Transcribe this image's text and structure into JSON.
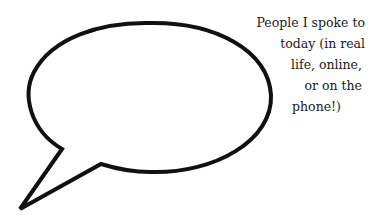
{
  "caption": {
    "lines": [
      {
        "text": "People I spoke to",
        "indent": 0
      },
      {
        "text": "today (in real",
        "indent": 0
      },
      {
        "text": "life, online,",
        "indent": 5
      },
      {
        "text": "or on the",
        "indent": 2
      },
      {
        "text": "phone!)",
        "indent": 26
      }
    ]
  },
  "colors": {
    "stroke": "#111111",
    "background": "#ffffff",
    "text": "#1a1a1a"
  }
}
